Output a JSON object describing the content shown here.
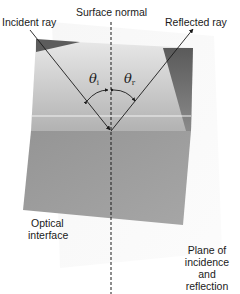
{
  "diagram": {
    "labels": {
      "surface_normal": "Surface normal",
      "incident_ray": "Incident ray",
      "reflected_ray": "Reflected ray",
      "optical_interface_line1": "Optical",
      "optical_interface_line2": "interface",
      "plane_line1": "Plane of",
      "plane_line2": "incidence",
      "plane_line3": "and",
      "plane_line4": "reflection"
    },
    "angles": {
      "incidence_symbol": "θ",
      "incidence_subscript": "i",
      "reflection_symbol": "θ",
      "reflection_subscript": "r"
    },
    "colors": {
      "upper_medium_top": "#e6e6e6",
      "upper_medium_bottom": "#b4b4b4",
      "lower_medium": "#9a9a9a",
      "shadow_dark": "#5c5c5c",
      "interface_highlight": "#f2f2f2",
      "plane_of_incidence": "#f3f3f3",
      "ray": "#1a1a1a"
    }
  }
}
